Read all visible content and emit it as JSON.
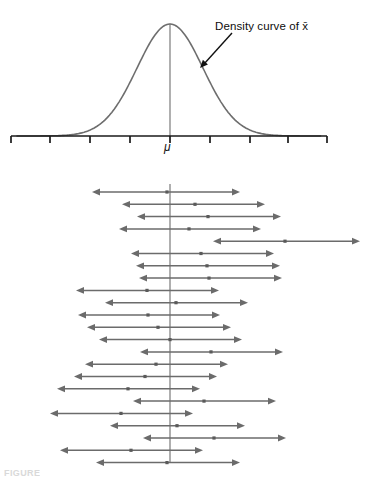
{
  "figure": {
    "caption": "FIGURE",
    "background": "#ffffff",
    "width": 376,
    "height": 478
  },
  "top_panel": {
    "name": "sampling-distribution-density-plot",
    "annotation_label": "Density curve of x̄",
    "axis_label_center": "μ",
    "curve_color": "#6e6e6e",
    "axis_color": "#1a1a1a",
    "arrow_color": "#111111",
    "axis": {
      "y": 136,
      "x_start": 11,
      "x_end": 327,
      "tick_height": 7,
      "ticks": [
        11,
        50,
        90,
        130,
        170,
        210,
        250,
        288,
        327
      ]
    },
    "center_line": {
      "x": 170,
      "y_top": 24,
      "y_bottom": 136
    },
    "curve": {
      "peak_x": 170,
      "peak_y": 24,
      "baseline_y": 136,
      "sigma": 33
    },
    "arrow": {
      "x1": 232,
      "y1": 33,
      "x2": 200,
      "y2": 68
    }
  },
  "bottom_panel": {
    "name": "confidence-intervals-plot",
    "line_color": "#6b6b6b",
    "center_line_color": "#7a7a7a",
    "dot_color": "#5a5a5a",
    "center_line": {
      "x": 170,
      "y_top": 184,
      "y_bottom": 462
    },
    "row_start_y": 192,
    "row_spacing": 12.3,
    "interval_count": 23,
    "misses_center_count": 1,
    "chart_data": {
      "type": "line",
      "title": "Confidence intervals from repeated samples",
      "xlabel": "",
      "ylabel": "",
      "center_value": 170,
      "legend": [],
      "grid": false,
      "series": [
        {
          "name": "interval-1",
          "left": 92,
          "right": 240,
          "estimate": 167,
          "covers_center": true
        },
        {
          "name": "interval-2",
          "left": 122,
          "right": 265,
          "estimate": 195,
          "covers_center": true
        },
        {
          "name": "interval-3",
          "left": 137,
          "right": 281,
          "estimate": 208,
          "covers_center": true
        },
        {
          "name": "interval-4",
          "left": 119,
          "right": 261,
          "estimate": 189,
          "covers_center": true
        },
        {
          "name": "interval-5",
          "left": 213,
          "right": 360,
          "estimate": 285,
          "covers_center": false
        },
        {
          "name": "interval-6",
          "left": 131,
          "right": 274,
          "estimate": 201,
          "covers_center": true
        },
        {
          "name": "interval-7",
          "left": 136,
          "right": 280,
          "estimate": 207,
          "covers_center": true
        },
        {
          "name": "interval-8",
          "left": 139,
          "right": 282,
          "estimate": 209,
          "covers_center": true
        },
        {
          "name": "interval-9",
          "left": 76,
          "right": 219,
          "estimate": 147,
          "covers_center": true
        },
        {
          "name": "interval-10",
          "left": 105,
          "right": 248,
          "estimate": 176,
          "covers_center": true
        },
        {
          "name": "interval-11",
          "left": 78,
          "right": 220,
          "estimate": 148,
          "covers_center": true
        },
        {
          "name": "interval-12",
          "left": 87,
          "right": 231,
          "estimate": 158,
          "covers_center": true
        },
        {
          "name": "interval-13",
          "left": 99,
          "right": 242,
          "estimate": 170,
          "covers_center": true
        },
        {
          "name": "interval-14",
          "left": 140,
          "right": 283,
          "estimate": 211,
          "covers_center": true
        },
        {
          "name": "interval-15",
          "left": 85,
          "right": 228,
          "estimate": 156,
          "covers_center": true
        },
        {
          "name": "interval-16",
          "left": 74,
          "right": 217,
          "estimate": 145,
          "covers_center": true
        },
        {
          "name": "interval-17",
          "left": 57,
          "right": 200,
          "estimate": 128,
          "covers_center": true
        },
        {
          "name": "interval-18",
          "left": 133,
          "right": 276,
          "estimate": 204,
          "covers_center": true
        },
        {
          "name": "interval-19",
          "left": 50,
          "right": 193,
          "estimate": 121,
          "covers_center": true
        },
        {
          "name": "interval-20",
          "left": 110,
          "right": 245,
          "estimate": 177,
          "covers_center": true
        },
        {
          "name": "interval-21",
          "left": 143,
          "right": 286,
          "estimate": 214,
          "covers_center": true
        },
        {
          "name": "interval-22",
          "left": 60,
          "right": 203,
          "estimate": 131,
          "covers_center": true
        },
        {
          "name": "interval-23",
          "left": 96,
          "right": 240,
          "estimate": 167,
          "covers_center": true
        }
      ]
    }
  }
}
